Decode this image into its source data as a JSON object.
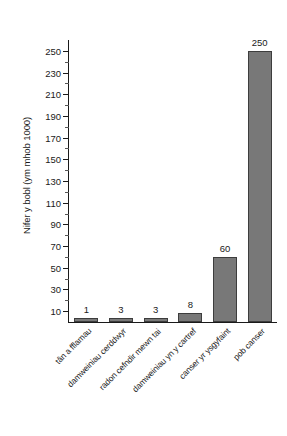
{
  "chart_data": {
    "type": "bar",
    "title": "",
    "subtitle": "",
    "xlabel": "",
    "ylabel": "Nifer y bobl (ym mhob 1000)",
    "categories": [
      "tân a fflamau",
      "damweiniau cerddwyr",
      "radon cefndir mewn tai",
      "damweiniau yn y cartref",
      "canser yr ysgyfaint",
      "pob canser"
    ],
    "values": [
      1,
      3,
      3,
      8,
      60,
      250
    ],
    "data_labels": [
      "1",
      "3",
      "3",
      "8",
      "60",
      "250"
    ],
    "ylim": [
      0,
      260
    ],
    "y_ticks": [
      10,
      30,
      50,
      70,
      90,
      110,
      130,
      150,
      170,
      190,
      210,
      230,
      250
    ],
    "y_tick_labels": [
      "10",
      "30",
      "50",
      "70",
      "90",
      "110",
      "130",
      "150",
      "170",
      "190",
      "210",
      "230",
      "250"
    ],
    "y_minor_ticks": [
      20,
      40,
      60,
      80,
      100,
      120,
      140,
      160,
      180,
      200,
      220,
      240
    ],
    "y_tick_step": 20,
    "grid": false,
    "legend": false,
    "legend_position": "none",
    "bar_color": "#787878",
    "bar_edge_color": "#3d3d3d",
    "axis_color": "#1a1a1a",
    "background_color": "#ffffff",
    "category_label_rotation": -45
  }
}
